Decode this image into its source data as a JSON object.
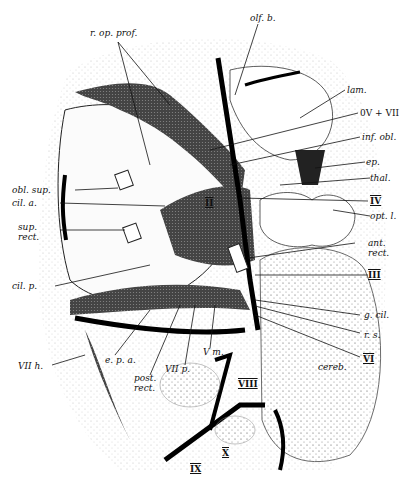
{
  "figure": {
    "colors": {
      "ink": "#111111",
      "stipple": "#555555",
      "paper": "#ffffff",
      "dark_fill": "#3a3a3a"
    }
  },
  "labels": {
    "r_op_prof": "r. op. prof.",
    "olf_b": "olf. b.",
    "lam": "lam.",
    "ov_vii": "0V + VII",
    "inf_obl": "inf. obl.",
    "ep": "ep.",
    "thal": "thal.",
    "obl_sup": "obl. sup.",
    "cil_a": "cil. a.",
    "ii": "II",
    "iv": "IV",
    "opt_l": "opt. l.",
    "sup_rect": "sup. rect.",
    "ant_rect": "ant. rect.",
    "iii": "III",
    "cil_p": "cil. p.",
    "g_cil": "g. cil.",
    "r_s": "r. s.",
    "vi": "VI",
    "vii_h": "VII h.",
    "e_p_a": "e. p. a.",
    "post_rect": "post. rect.",
    "vii_p": "VII p.",
    "v_m": "V m.",
    "viii": "VIII",
    "cereb": "cereb.",
    "ix": "IX",
    "x": "X"
  }
}
